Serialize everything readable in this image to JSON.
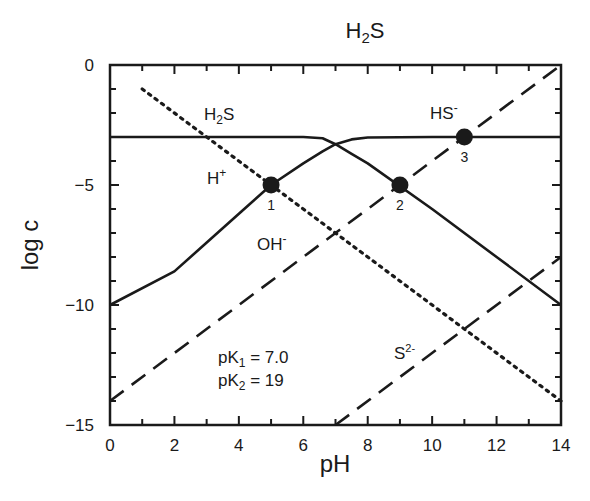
{
  "chart_data": {
    "type": "line",
    "title": "H2S",
    "title_main": "H",
    "title_sub": "2",
    "title_tail": "S",
    "xlabel": "pH",
    "ylabel": "log c",
    "xlim": [
      0,
      14
    ],
    "ylim": [
      -15,
      0
    ],
    "x_ticks_major": [
      0,
      2,
      4,
      6,
      8,
      10,
      12,
      14
    ],
    "x_tick_labels": [
      "0",
      "2",
      "4",
      "6",
      "8",
      "10",
      "12",
      "14"
    ],
    "y_ticks_major": [
      0,
      -5,
      -10,
      -15
    ],
    "y_tick_labels": [
      "0",
      "−5",
      "−10",
      "−15"
    ],
    "grid": false,
    "legend": "none (inline labels)",
    "annotations": {
      "pK1": "pK₁ = 7.0",
      "pK2": "pK₂ = 19",
      "pK1_parts": {
        "base": "pK",
        "sub": "1",
        "rest": " = 7.0"
      },
      "pK2_parts": {
        "base": "pK",
        "sub": "2",
        "rest": " = 19"
      }
    },
    "series": [
      {
        "name": "H2S",
        "label": "H₂S",
        "style": "solid",
        "x": [
          0,
          6,
          6.6,
          7,
          7.5,
          8,
          10,
          12,
          14
        ],
        "y": [
          -3,
          -3,
          -3.05,
          -3.3,
          -3.7,
          -4.1,
          -6,
          -8,
          -10
        ]
      },
      {
        "name": "HS-",
        "label": "HS⁻",
        "style": "solid",
        "x": [
          0,
          2,
          4,
          5,
          6,
          6.6,
          7,
          7.5,
          8,
          10,
          14
        ],
        "y": [
          -10,
          -8.6,
          -6.2,
          -5,
          -4.1,
          -3.6,
          -3.3,
          -3.1,
          -3.02,
          -3,
          -3
        ]
      },
      {
        "name": "H+",
        "label": "H⁺",
        "style": "dotted",
        "x": [
          1,
          14
        ],
        "y": [
          -1,
          -14
        ]
      },
      {
        "name": "OH-",
        "label": "OH⁻",
        "style": "dashed",
        "x": [
          0,
          14
        ],
        "y": [
          -14,
          0
        ]
      },
      {
        "name": "S2-",
        "label": "S²⁻",
        "style": "dashed",
        "x": [
          7,
          14
        ],
        "y": [
          -15,
          -8
        ]
      }
    ],
    "points": [
      {
        "label": "1",
        "x": 5,
        "y": -5
      },
      {
        "label": "2",
        "x": 9,
        "y": -5
      },
      {
        "label": "3",
        "x": 11,
        "y": -3
      }
    ]
  },
  "labels": {
    "h2s_base": "H",
    "h2s_sub": "2",
    "h2s_tail": "S",
    "hs_base": "HS",
    "hs_sup": "-",
    "h_base": "H",
    "h_sup": "+",
    "oh_base": "OH",
    "oh_sup": "-",
    "s_base": "S",
    "s_sup": "2-"
  }
}
